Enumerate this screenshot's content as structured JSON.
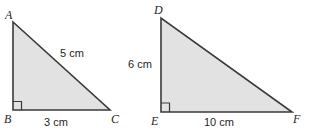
{
  "figure": {
    "background_color": "#ffffff",
    "fill_color": "#e2e2e2",
    "stroke_color": "#3a3a3a",
    "text_color": "#262626"
  },
  "triangles": [
    {
      "id": "abc",
      "vertices": {
        "apex": {
          "label": "A",
          "x": 13,
          "y": 22
        },
        "right_angle": {
          "label": "B",
          "x": 13,
          "y": 110
        },
        "base_end": {
          "label": "C",
          "x": 110,
          "y": 110
        }
      },
      "measures": {
        "hypotenuse": "5 cm",
        "base": "3 cm"
      },
      "right_angle_at": "B"
    },
    {
      "id": "def",
      "vertices": {
        "apex": {
          "label": "D",
          "x": 161,
          "y": 18
        },
        "right_angle": {
          "label": "E",
          "x": 161,
          "y": 112
        },
        "base_end": {
          "label": "F",
          "x": 292,
          "y": 112
        }
      },
      "measures": {
        "vertical_leg": "6 cm",
        "base": "10 cm"
      },
      "right_angle_at": "E"
    }
  ],
  "labels": {
    "a": "A",
    "b": "B",
    "c": "C",
    "d": "D",
    "e": "E",
    "f": "F",
    "abc_hypotenuse": "5 cm",
    "abc_base": "3 cm",
    "def_leg": "6 cm",
    "def_base": "10 cm"
  }
}
